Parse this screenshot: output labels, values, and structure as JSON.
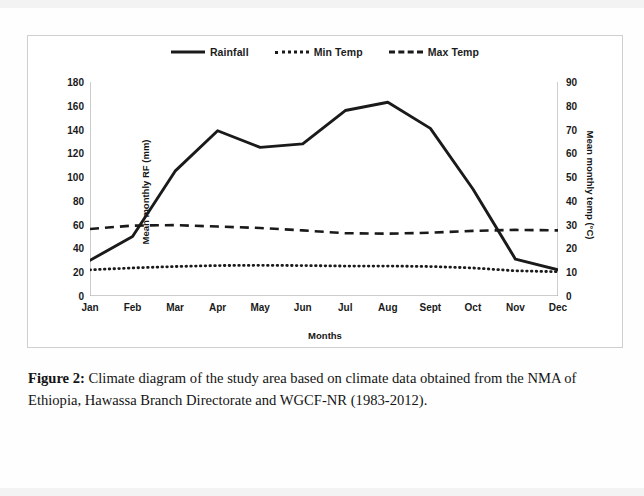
{
  "figure": {
    "caption_label": "Figure 2:",
    "caption_text": " Climate diagram of the study area based on climate data obtained from the NMA of Ethiopia, Hawassa Branch Directorate and WGCF-NR (1983-2012)."
  },
  "legend": {
    "items": [
      {
        "label": "Rainfall",
        "style": "solid"
      },
      {
        "label": "Min Temp",
        "style": "dotted"
      },
      {
        "label": "Max Temp",
        "style": "dashed"
      }
    ]
  },
  "axes": {
    "left_title": "Mean monthly RF (mm)",
    "right_title": "Mean monthly temp (°C)",
    "x_title": "Months",
    "left_ticks": [
      "0",
      "20",
      "40",
      "60",
      "80",
      "100",
      "120",
      "140",
      "160",
      "180"
    ],
    "right_ticks": [
      "0",
      "10",
      "20",
      "30",
      "40",
      "50",
      "60",
      "70",
      "80",
      "90"
    ]
  },
  "chart_data": {
    "type": "line",
    "title": "",
    "xlabel": "Months",
    "ylabel": "Mean monthly RF (mm)",
    "y2label": "Mean monthly temp (°C)",
    "categories": [
      "Jan",
      "Feb",
      "Mar",
      "Apr",
      "May",
      "Jun",
      "Jul",
      "Aug",
      "Sept",
      "Oct",
      "Nov",
      "Dec"
    ],
    "ylim": [
      0,
      180
    ],
    "y2lim": [
      0,
      90
    ],
    "grid": false,
    "legend_position": "top",
    "series": [
      {
        "name": "Rainfall",
        "axis": "left",
        "units": "mm",
        "style": "solid",
        "color": "#1a1a1a",
        "values": [
          30,
          50,
          105,
          139,
          125,
          128,
          156,
          163,
          141,
          90,
          31,
          22
        ]
      },
      {
        "name": "Min Temp",
        "axis": "right",
        "units": "°C",
        "style": "dotted",
        "color": "#1a1a1a",
        "values": [
          11.0,
          11.8,
          12.4,
          12.8,
          12.9,
          12.8,
          12.6,
          12.6,
          12.4,
          11.8,
          10.6,
          10.2
        ]
      },
      {
        "name": "Max Temp",
        "axis": "right",
        "units": "°C",
        "style": "dashed",
        "color": "#1a1a1a",
        "values": [
          28.2,
          29.6,
          29.8,
          29.2,
          28.6,
          27.6,
          26.4,
          26.2,
          26.6,
          27.4,
          27.8,
          27.6
        ]
      }
    ]
  }
}
